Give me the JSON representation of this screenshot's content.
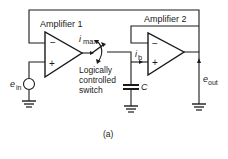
{
  "diagram": {
    "caption": "(a)",
    "amplifier1": {
      "label": "Amplifier 1",
      "minus": "−",
      "plus": "+"
    },
    "amplifier2": {
      "label": "Amplifier 2",
      "minus": "−",
      "plus": "+"
    },
    "switch": {
      "label_line1": "Logically",
      "label_line2": "controlled",
      "label_line3": "switch"
    },
    "currents": {
      "imax_main": "i",
      "imax_sub": "max",
      "ib_main": "i",
      "ib_sub": "b"
    },
    "capacitor": {
      "label": "C"
    },
    "input": {
      "main": "e",
      "sub": "in"
    },
    "output": {
      "main": "e",
      "sub": "out"
    }
  }
}
